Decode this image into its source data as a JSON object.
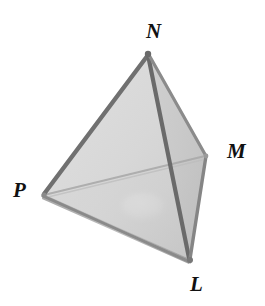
{
  "figure": {
    "name": "tetrahedron-diagram",
    "background_color": "#ffffff",
    "labels": [
      {
        "id": "N",
        "text": "N",
        "role": "apex-vertex"
      },
      {
        "id": "M",
        "text": "M",
        "role": "back-right-vertex"
      },
      {
        "id": "P",
        "text": "P",
        "role": "left-vertex"
      },
      {
        "id": "L",
        "text": "L",
        "role": "front-bottom-vertex"
      }
    ],
    "colors": {
      "edge_dark": "#6f6f6f",
      "edge_mid": "#8d8d8d",
      "edge_faint": "#b4b4b4",
      "face_left": "#d9d9d9",
      "face_right": "#c9c9c9",
      "face_base": "#cfcfcf",
      "oval_highlight": "#ededed",
      "label_color": "#111111"
    },
    "geometry": {
      "vertices": {
        "N": {
          "x": 148,
          "y": 53
        },
        "P": {
          "x": 43,
          "y": 194
        },
        "L": {
          "x": 190,
          "y": 259
        },
        "M": {
          "x": 206,
          "y": 155
        }
      },
      "edges": [
        {
          "from": "N",
          "to": "P",
          "style": "solid-dark"
        },
        {
          "from": "N",
          "to": "L",
          "style": "solid-dark"
        },
        {
          "from": "N",
          "to": "M",
          "style": "solid-dark"
        },
        {
          "from": "P",
          "to": "L",
          "style": "solid-mid"
        },
        {
          "from": "M",
          "to": "L",
          "style": "solid-dark"
        },
        {
          "from": "P",
          "to": "M",
          "style": "faint-hidden"
        }
      ],
      "oval": {
        "cx": 143,
        "cy": 206,
        "rx": 21,
        "ry": 13
      }
    }
  }
}
